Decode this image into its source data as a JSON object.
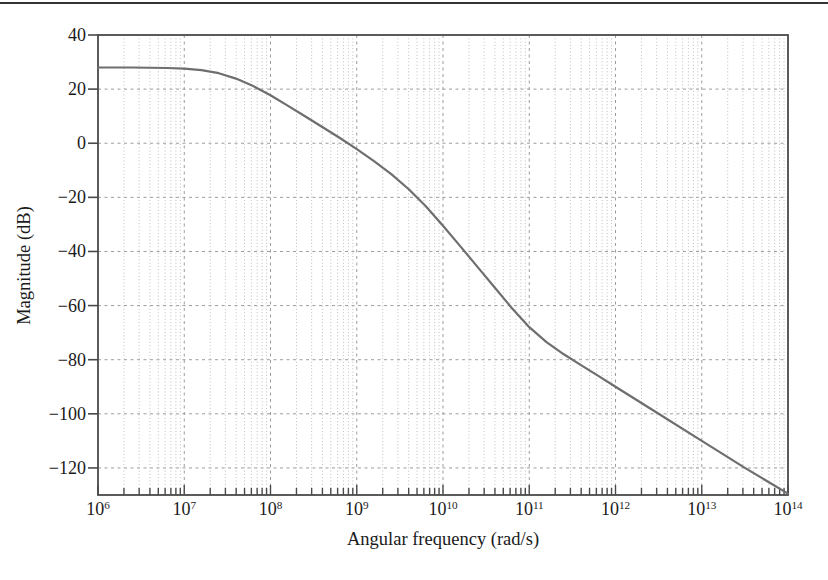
{
  "chart_data": {
    "type": "line",
    "title": "",
    "xlabel": "Angular frequency (rad/s)",
    "ylabel": "Magnitude (dB)",
    "x_scale": "log",
    "x_range_exponents": [
      6,
      14
    ],
    "ylim": [
      -130,
      40
    ],
    "y_tick_values": [
      40,
      20,
      0,
      -20,
      -40,
      -60,
      -80,
      -100,
      -120
    ],
    "x_tick_exponents": [
      6,
      7,
      8,
      9,
      10,
      11,
      12,
      13,
      14
    ],
    "x_tick_base": "10",
    "grid": {
      "major_style": "dashed",
      "minor_vertical_style": "dotted",
      "minor_horizontal": false
    },
    "legend": false,
    "series": [
      {
        "name": "magnitude-response",
        "points_log10w_db": [
          [
            6.0,
            28.0
          ],
          [
            6.4,
            28.0
          ],
          [
            6.8,
            27.8
          ],
          [
            7.0,
            27.6
          ],
          [
            7.2,
            27.0
          ],
          [
            7.4,
            25.9
          ],
          [
            7.6,
            23.9
          ],
          [
            7.8,
            21.1
          ],
          [
            8.0,
            17.7
          ],
          [
            8.2,
            13.9
          ],
          [
            8.4,
            10.0
          ],
          [
            8.6,
            6.0
          ],
          [
            8.8,
            2.0
          ],
          [
            9.0,
            -2.2
          ],
          [
            9.2,
            -6.6
          ],
          [
            9.4,
            -11.4
          ],
          [
            9.6,
            -16.9
          ],
          [
            9.8,
            -23.3
          ],
          [
            10.0,
            -30.5
          ],
          [
            10.2,
            -38.0
          ],
          [
            10.4,
            -45.7
          ],
          [
            10.6,
            -53.3
          ],
          [
            10.8,
            -61.0
          ],
          [
            11.0,
            -68.0
          ],
          [
            11.2,
            -73.5
          ],
          [
            11.4,
            -78.0
          ],
          [
            11.6,
            -82.0
          ],
          [
            11.8,
            -86.0
          ],
          [
            12.0,
            -90.0
          ],
          [
            12.5,
            -100.0
          ],
          [
            13.0,
            -110.0
          ],
          [
            13.5,
            -120.0
          ],
          [
            14.0,
            -129.5
          ]
        ]
      }
    ],
    "derived_features": {
      "low_frequency_gain_db": 28,
      "approx_corner_frequencies_rad_s": [
        32000000.0,
        4000000000.0,
        100000000000.0
      ],
      "segment_slopes_db_per_decade": [
        0,
        -20,
        -40,
        -20
      ]
    },
    "colors": {
      "curve": "#6e6e6e",
      "axis": "#4a4a4a",
      "grid_major": "#9c9c9c",
      "grid_minor": "#bdbdbd",
      "text": "#1a1a1a",
      "top_rule": "#333333",
      "background": "#ffffff"
    }
  }
}
